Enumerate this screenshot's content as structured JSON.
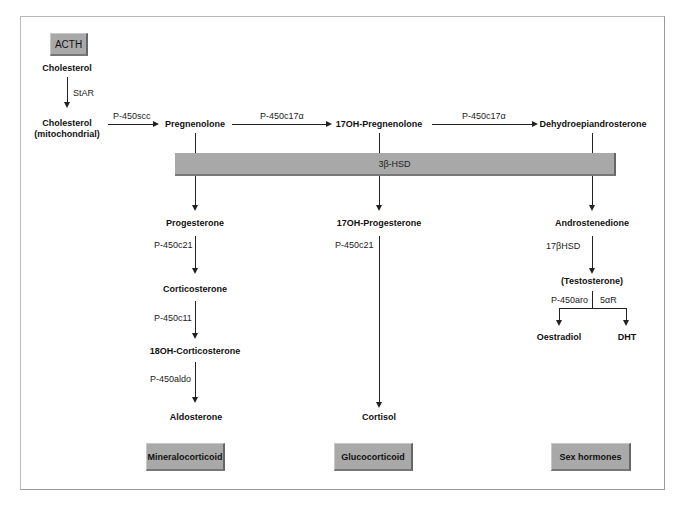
{
  "diagram": {
    "stimulus": "ACTH",
    "nodes": {
      "cholesterol": "Cholesterol",
      "cholesterol_mito_line1": "Cholesterol",
      "cholesterol_mito_line2": "(mitochondrial)",
      "pregnenolone": "Pregnenolone",
      "oh17_pregnenolone": "17OH-Pregnenolone",
      "dhea": "Dehydroepiandrosterone",
      "progesterone": "Progesterone",
      "corticosterone": "Corticosterone",
      "oh18_corticosterone": "18OH-Corticosterone",
      "aldosterone": "Aldosterone",
      "oh17_progesterone": "17OH-Progesterone",
      "cortisol": "Cortisol",
      "androstenedione": "Androstenedione",
      "testosterone": "(Testosterone)",
      "oestradiol": "Oestradiol",
      "dht": "DHT"
    },
    "enzymes": {
      "star": "StAR",
      "p450scc": "P-450scc",
      "p450c17a_1": "P-450c17α",
      "p450c17a_2": "P-450c17α",
      "hsd3b": "3β-HSD",
      "p450c21_min": "P-450c21",
      "p450c11": "P-450c11",
      "p450aldo": "P-450aldo",
      "p450c21_glu": "P-450c21",
      "hsd17b": "17βHSD",
      "p450aro": "P-450aro",
      "r5a": "5αR"
    },
    "classes": {
      "mineralocorticoid": "Mineralocorticoid",
      "glucocorticoid": "Glucocorticoid",
      "sex_hormones": "Sex hormones"
    },
    "colors": {
      "box_fill": "#a9a9a9",
      "line": "#222222",
      "frame": "#b8b8b8"
    }
  }
}
